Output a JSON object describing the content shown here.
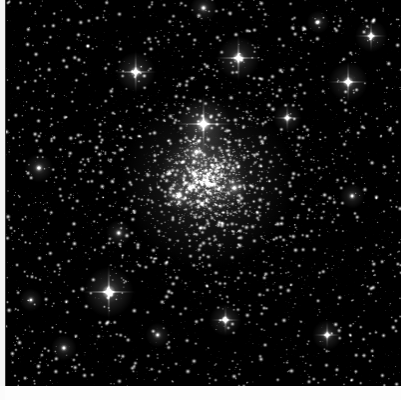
{
  "image": {
    "title": "Globular star cluster core",
    "subject": "dense globular cluster with resolved member stars",
    "alt_text": "A black-and-white astronomical image of a dense globular star cluster, thousands of white point-like stars on a black sky, with a bright concentrated core slightly above and left of centre and several bright foreground stars showing four-point diffraction spikes.",
    "color_mode": "monochrome grayscale",
    "background_color": "#000000",
    "star_color": "#ffffff",
    "margin_color": "#f4f4f4",
    "caption": "",
    "frame": {
      "left": 5,
      "top": 0,
      "width": 396,
      "height": 386
    }
  },
  "field": {
    "cluster_center_x_pct": 51,
    "cluster_center_y_pct": 47,
    "core_radius_pct": 14,
    "halo_radius_pct": 30,
    "total_star_count": 5200,
    "core_star_count": 1500,
    "field_star_count": 3200,
    "seed": 20240517
  },
  "bright_stars": [
    {
      "name": "spike-star-upper-centre",
      "x": 203,
      "y": 124,
      "radius": 7.5,
      "spikes": true,
      "spike_length": 30,
      "brightness": 1.0
    },
    {
      "name": "spike-star-lower-left",
      "x": 108,
      "y": 292,
      "radius": 7.0,
      "spikes": true,
      "spike_length": 28,
      "brightness": 0.97
    },
    {
      "name": "spike-star-upper-right-of-centre",
      "x": 238,
      "y": 58,
      "radius": 6.0,
      "spikes": true,
      "spike_length": 24,
      "brightness": 0.92
    },
    {
      "name": "spike-star-upper-left",
      "x": 135,
      "y": 72,
      "radius": 5.5,
      "spikes": true,
      "spike_length": 22,
      "brightness": 0.9
    },
    {
      "name": "spike-star-right-upper",
      "x": 348,
      "y": 82,
      "radius": 5.5,
      "spikes": true,
      "spike_length": 21,
      "brightness": 0.89
    },
    {
      "name": "spike-star-far-right",
      "x": 371,
      "y": 36,
      "radius": 4.5,
      "spikes": true,
      "spike_length": 16,
      "brightness": 0.82
    },
    {
      "name": "bright-star-right-of-core",
      "x": 287,
      "y": 118,
      "radius": 4.0,
      "spikes": true,
      "spike_length": 14,
      "brightness": 0.8
    },
    {
      "name": "bright-star-left-mid",
      "x": 38,
      "y": 168,
      "radius": 4.0,
      "spikes": false,
      "spike_length": 0,
      "brightness": 0.78
    },
    {
      "name": "bright-star-lower-centre",
      "x": 225,
      "y": 320,
      "radius": 4.5,
      "spikes": true,
      "spike_length": 15,
      "brightness": 0.84
    },
    {
      "name": "bright-star-lower-right",
      "x": 327,
      "y": 335,
      "radius": 4.2,
      "spikes": true,
      "spike_length": 14,
      "brightness": 0.82
    },
    {
      "name": "bright-star-lower-left-field",
      "x": 63,
      "y": 348,
      "radius": 3.6,
      "spikes": false,
      "spike_length": 0,
      "brightness": 0.74
    },
    {
      "name": "bright-star-left-lower",
      "x": 118,
      "y": 233,
      "radius": 3.6,
      "spikes": false,
      "spike_length": 0,
      "brightness": 0.74
    },
    {
      "name": "bright-star-core-north",
      "x": 196,
      "y": 152,
      "radius": 4.0,
      "spikes": false,
      "spike_length": 0,
      "brightness": 0.86
    },
    {
      "name": "bright-star-core-west",
      "x": 178,
      "y": 196,
      "radius": 4.2,
      "spikes": false,
      "spike_length": 0,
      "brightness": 0.88
    },
    {
      "name": "bright-star-core-east",
      "x": 234,
      "y": 188,
      "radius": 3.8,
      "spikes": false,
      "spike_length": 0,
      "brightness": 0.86
    },
    {
      "name": "bright-star-right-mid",
      "x": 352,
      "y": 196,
      "radius": 3.5,
      "spikes": false,
      "spike_length": 0,
      "brightness": 0.72
    },
    {
      "name": "bright-star-top-centre",
      "x": 203,
      "y": 8,
      "radius": 3.8,
      "spikes": false,
      "spike_length": 0,
      "brightness": 0.76
    },
    {
      "name": "bright-star-top-right",
      "x": 318,
      "y": 22,
      "radius": 3.2,
      "spikes": false,
      "spike_length": 0,
      "brightness": 0.7
    },
    {
      "name": "bright-star-mid-left-pair",
      "x": 30,
      "y": 300,
      "radius": 3.2,
      "spikes": false,
      "spike_length": 0,
      "brightness": 0.7
    },
    {
      "name": "bright-star-lower-mid-left",
      "x": 157,
      "y": 335,
      "radius": 3.4,
      "spikes": false,
      "spike_length": 0,
      "brightness": 0.72
    }
  ]
}
